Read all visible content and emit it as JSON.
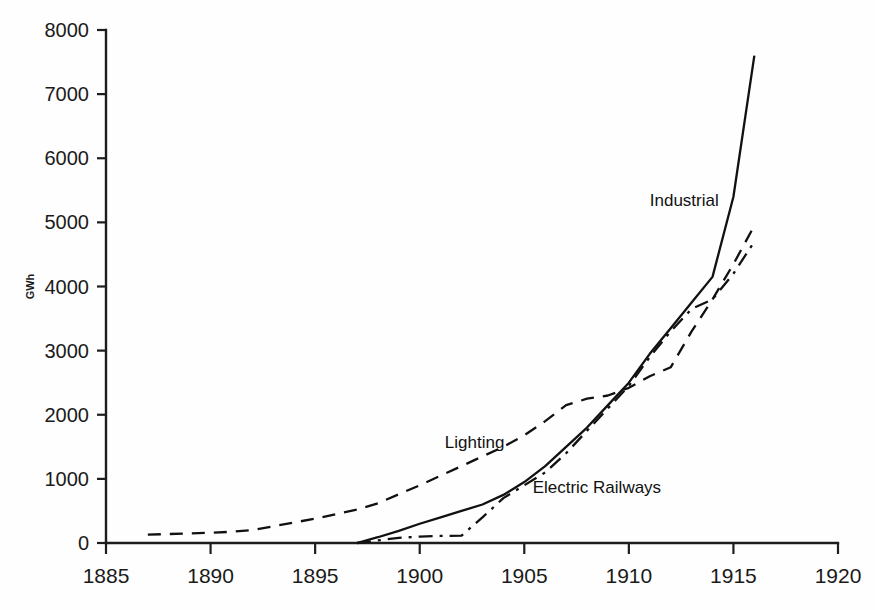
{
  "chart_data": {
    "type": "line",
    "title": "",
    "subtitle": "",
    "xlabel": "",
    "ylabel": "GWh",
    "xlim": [
      1885,
      1920
    ],
    "ylim": [
      0,
      8000
    ],
    "grid": false,
    "legend_position": "inline-labels",
    "x_ticks": [
      "1885",
      "1890",
      "1895",
      "1900",
      "1905",
      "1910",
      "1915",
      "1920"
    ],
    "x_tick_values": [
      1885,
      1890,
      1895,
      1900,
      1905,
      1910,
      1915,
      1920
    ],
    "y_ticks": [
      "0",
      "1000",
      "2000",
      "3000",
      "4000",
      "5000",
      "6000",
      "7000",
      "8000"
    ],
    "y_tick_values": [
      0,
      1000,
      2000,
      3000,
      4000,
      5000,
      6000,
      7000,
      8000
    ],
    "series": [
      {
        "name": "Industrial",
        "line_style": "solid",
        "color": "#111111",
        "label_x": 1911.0,
        "label_y": 5250,
        "x": [
          1897,
          1898,
          1899,
          1900,
          1901,
          1902,
          1903,
          1904,
          1905,
          1906,
          1907,
          1908,
          1909,
          1910,
          1911,
          1912,
          1913,
          1914,
          1915,
          1916
        ],
        "values": [
          0,
          90,
          190,
          300,
          400,
          500,
          600,
          750,
          950,
          1200,
          1500,
          1800,
          2150,
          2500,
          2950,
          3350,
          3750,
          4150,
          5400,
          7600
        ]
      },
      {
        "name": "Lighting",
        "line_style": "dashed",
        "color": "#111111",
        "label_x": 1901.2,
        "label_y": 1480,
        "x": [
          1887,
          1888,
          1889,
          1890,
          1891,
          1892,
          1893,
          1894,
          1895,
          1896,
          1897,
          1898,
          1899,
          1900,
          1901,
          1902,
          1903,
          1904,
          1905,
          1906,
          1907,
          1908,
          1909,
          1910,
          1911,
          1912,
          1913,
          1914,
          1915,
          1916
        ],
        "values": [
          130,
          140,
          150,
          160,
          175,
          200,
          260,
          320,
          380,
          450,
          520,
          620,
          760,
          900,
          1050,
          1200,
          1350,
          1500,
          1680,
          1900,
          2150,
          2250,
          2300,
          2420,
          2600,
          2740,
          3300,
          3800,
          4350,
          4950
        ]
      },
      {
        "name": "Electric Railways",
        "line_style": "dash-dot",
        "color": "#111111",
        "label_x": 1905.4,
        "label_y": 780,
        "x": [
          1897,
          1898,
          1899,
          1900,
          1901,
          1902,
          1903,
          1904,
          1905,
          1906,
          1907,
          1908,
          1909,
          1910,
          1911,
          1912,
          1913,
          1914,
          1915,
          1916
        ],
        "values": [
          0,
          40,
          80,
          100,
          110,
          115,
          400,
          700,
          900,
          1100,
          1400,
          1750,
          2100,
          2450,
          2900,
          3300,
          3650,
          3800,
          4200,
          4700
        ]
      }
    ],
    "annotations": [
      {
        "text": "Industrial",
        "x": 1911.0,
        "y": 5250
      },
      {
        "text": "Lighting",
        "x": 1901.2,
        "y": 1480
      },
      {
        "text": "Electric Railways",
        "x": 1905.4,
        "y": 780
      }
    ]
  }
}
